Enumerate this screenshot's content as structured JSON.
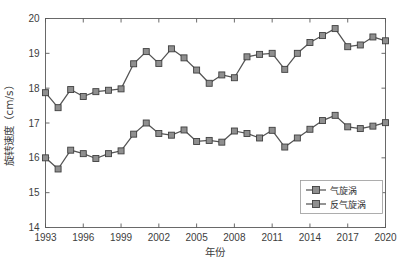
{
  "chart_data": {
    "type": "line",
    "title": "",
    "xlabel": "年份",
    "ylabel": "旋转速度（cm/s）",
    "xlim": [
      1993,
      2020
    ],
    "ylim": [
      14,
      20
    ],
    "xticks": [
      1993,
      1996,
      1999,
      2002,
      2005,
      2008,
      2011,
      2014,
      2017,
      2020
    ],
    "yticks": [
      14,
      15,
      16,
      17,
      18,
      19,
      20
    ],
    "grid": false,
    "legend_position": "bottom-right",
    "x": [
      1993,
      1994,
      1995,
      1996,
      1997,
      1998,
      1999,
      2000,
      2001,
      2002,
      2003,
      2004,
      2005,
      2006,
      2007,
      2008,
      2009,
      2010,
      2011,
      2012,
      2013,
      2014,
      2015,
      2016,
      2017,
      2018,
      2019,
      2020
    ],
    "series": [
      {
        "name": "气旋涡",
        "color": "#545454",
        "marker": "square",
        "values": [
          16.0,
          15.68,
          16.22,
          16.12,
          15.98,
          16.12,
          16.2,
          16.68,
          17.0,
          16.7,
          16.65,
          16.8,
          16.47,
          16.5,
          16.45,
          16.77,
          16.7,
          16.57,
          16.79,
          16.31,
          16.57,
          16.82,
          17.07,
          17.22,
          16.89,
          16.84,
          16.91,
          17.01
        ]
      },
      {
        "name": "反气旋涡",
        "color": "#545454",
        "marker": "square",
        "values": [
          17.87,
          17.44,
          17.96,
          17.76,
          17.9,
          17.94,
          17.98,
          18.7,
          19.05,
          18.71,
          19.13,
          18.87,
          18.52,
          18.14,
          18.38,
          18.3,
          18.9,
          18.97,
          19.0,
          18.54,
          19.0,
          19.31,
          19.51,
          19.71,
          19.19,
          19.24,
          19.47,
          19.36
        ]
      }
    ]
  },
  "legend": {
    "entries": [
      {
        "label": "气旋涡"
      },
      {
        "label": "反气旋涡"
      }
    ]
  },
  "axes": {
    "x_title": "年份",
    "y_title": "旋转速度（cm/s）",
    "x_tick_labels": [
      "1993",
      "1996",
      "1999",
      "2002",
      "2005",
      "2008",
      "2011",
      "2014",
      "2017",
      "2020"
    ],
    "y_tick_labels": [
      "14",
      "15",
      "16",
      "17",
      "18",
      "19",
      "20"
    ]
  }
}
